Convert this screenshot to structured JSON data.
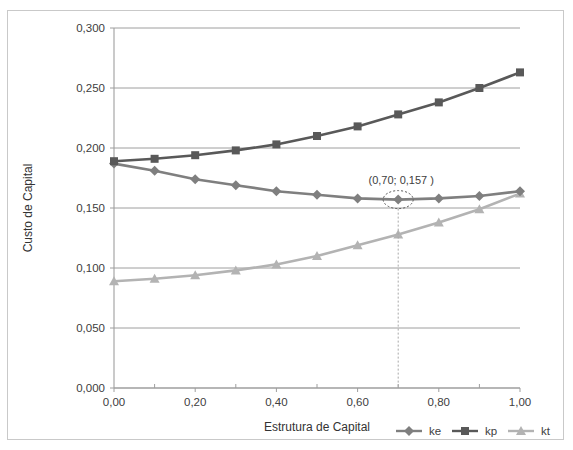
{
  "chart_data": {
    "type": "line",
    "title": "",
    "xlabel": "Estrutura de Capital",
    "ylabel": "Custo de Capital",
    "x": [
      0.0,
      0.1,
      0.2,
      0.3,
      0.4,
      0.5,
      0.6,
      0.7,
      0.8,
      0.9,
      1.0
    ],
    "xtick_labels": [
      "0,00",
      "0,20",
      "0,40",
      "0,60",
      "0,80",
      "1,00"
    ],
    "xtick_values": [
      0.0,
      0.2,
      0.4,
      0.6,
      0.8,
      1.0
    ],
    "xminor_values": [
      0.1,
      0.3,
      0.5,
      0.7,
      0.9
    ],
    "ytick_labels": [
      "0,000",
      "0,050",
      "0,100",
      "0,150",
      "0,200",
      "0,250",
      "0,300"
    ],
    "ytick_values": [
      0.0,
      0.05,
      0.1,
      0.15,
      0.2,
      0.25,
      0.3
    ],
    "xlim": [
      0.0,
      1.0
    ],
    "ylim": [
      0.0,
      0.3
    ],
    "grid": "horizontal",
    "legend_position": "bottom-right",
    "series": [
      {
        "name": "ke",
        "marker": "diamond",
        "color": "#7f7f7f",
        "values": [
          0.187,
          0.181,
          0.174,
          0.169,
          0.164,
          0.161,
          0.158,
          0.157,
          0.158,
          0.16,
          0.164
        ]
      },
      {
        "name": "kp",
        "marker": "square",
        "color": "#595959",
        "values": [
          0.189,
          0.191,
          0.194,
          0.198,
          0.203,
          0.21,
          0.218,
          0.228,
          0.238,
          0.25,
          0.263
        ]
      },
      {
        "name": "kt",
        "marker": "triangle",
        "color": "#b3b3b3",
        "values": [
          0.089,
          0.091,
          0.094,
          0.098,
          0.103,
          0.11,
          0.119,
          0.128,
          0.138,
          0.149,
          0.162
        ]
      }
    ],
    "annotations": [
      {
        "text": "(0,70; 0,157 )",
        "x": 0.7,
        "y": 0.157,
        "series": "ke",
        "style": "dotted-ellipse-with-dropline"
      }
    ]
  },
  "legend": {
    "items": [
      {
        "label": "ke",
        "marker": "diamond",
        "color": "#7f7f7f"
      },
      {
        "label": "kp",
        "marker": "square",
        "color": "#595959"
      },
      {
        "label": "kt",
        "marker": "triangle",
        "color": "#b3b3b3"
      }
    ]
  }
}
